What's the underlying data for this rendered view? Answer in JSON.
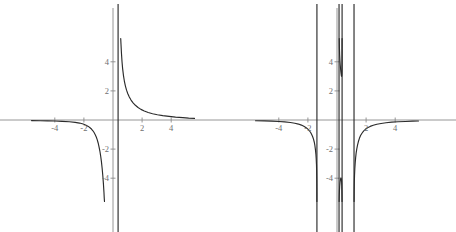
{
  "figure": {
    "kind": "two-panel-line-plot",
    "background_color": "#ffffff",
    "curve_color": "#2b2b2b",
    "axis_color": "#8a8a8a",
    "tick_label_color": "#6f6f6f"
  },
  "chart_data": [
    {
      "type": "line",
      "panel": "left",
      "title": "",
      "xlabel": "",
      "ylabel": "",
      "xlim": [
        -5.6,
        5.6
      ],
      "ylim": [
        -5.6,
        5.6
      ],
      "grid": false,
      "legend": null,
      "x_ticks": [
        -4,
        -2,
        2,
        4
      ],
      "x_tick_labels": [
        "-4",
        "-2",
        "2",
        "4"
      ],
      "y_ticks": [
        -4,
        -2,
        2,
        4
      ],
      "y_tick_labels": [
        "-4",
        "-2",
        "2",
        "4"
      ],
      "asymptotes": {
        "vertical": [
          0.35
        ],
        "horizontal": [
          0
        ]
      },
      "series": [
        {
          "name": "branch-left",
          "points": [
            [
              -5.6,
              -0.04
            ],
            [
              -5.0,
              -0.05
            ],
            [
              -4.5,
              -0.06
            ],
            [
              -4.0,
              -0.07
            ],
            [
              -3.5,
              -0.09
            ],
            [
              -3.0,
              -0.12
            ],
            [
              -2.6,
              -0.16
            ],
            [
              -2.3,
              -0.21
            ],
            [
              -2.05,
              -0.28
            ],
            [
              -1.85,
              -0.36
            ],
            [
              -1.7,
              -0.44
            ],
            [
              -1.58,
              -0.53
            ],
            [
              -1.48,
              -0.62
            ],
            [
              -1.38,
              -0.74
            ],
            [
              -1.3,
              -0.86
            ],
            [
              -1.22,
              -1.01
            ],
            [
              -1.15,
              -1.17
            ],
            [
              -1.08,
              -1.37
            ],
            [
              -1.02,
              -1.58
            ],
            [
              -0.96,
              -1.84
            ],
            [
              -0.9,
              -2.15
            ],
            [
              -0.85,
              -2.46
            ],
            [
              -0.8,
              -2.83
            ],
            [
              -0.75,
              -3.28
            ],
            [
              -0.7,
              -3.83
            ],
            [
              -0.66,
              -4.37
            ],
            [
              -0.62,
              -5.0
            ],
            [
              -0.6,
              -5.4
            ],
            [
              -0.585,
              -5.6
            ]
          ]
        },
        {
          "name": "branch-right",
          "points": [
            [
              0.53,
              5.6
            ],
            [
              0.55,
              5.2
            ],
            [
              0.58,
              4.6
            ],
            [
              0.62,
              4.0
            ],
            [
              0.66,
              3.55
            ],
            [
              0.72,
              3.05
            ],
            [
              0.78,
              2.68
            ],
            [
              0.85,
              2.35
            ],
            [
              0.93,
              2.05
            ],
            [
              1.02,
              1.8
            ],
            [
              1.12,
              1.58
            ],
            [
              1.24,
              1.37
            ],
            [
              1.38,
              1.18
            ],
            [
              1.54,
              1.01
            ],
            [
              1.72,
              0.86
            ],
            [
              1.92,
              0.73
            ],
            [
              2.15,
              0.62
            ],
            [
              2.42,
              0.52
            ],
            [
              2.72,
              0.43
            ],
            [
              3.05,
              0.36
            ],
            [
              3.42,
              0.3
            ],
            [
              3.85,
              0.25
            ],
            [
              4.3,
              0.2
            ],
            [
              4.8,
              0.16
            ],
            [
              5.2,
              0.13
            ],
            [
              5.6,
              0.11
            ]
          ]
        }
      ]
    },
    {
      "type": "line",
      "panel": "right",
      "title": "",
      "xlabel": "",
      "ylabel": "",
      "xlim": [
        -5.6,
        5.6
      ],
      "ylim": [
        -5.6,
        5.6
      ],
      "grid": false,
      "legend": null,
      "x_ticks": [
        -4,
        -2,
        2,
        4
      ],
      "x_tick_labels": [
        "-4",
        "-2",
        "2",
        "4"
      ],
      "y_ticks": [
        -4,
        -2,
        2,
        4
      ],
      "y_tick_labels": [
        "-4",
        "-2",
        "2",
        "4"
      ],
      "asymptotes": {
        "vertical": [
          -1.38,
          0.14,
          0.35,
          1.17
        ],
        "horizontal": [
          0
        ]
      },
      "series": [
        {
          "name": "branch-far-left",
          "points": [
            [
              -5.6,
              -0.05
            ],
            [
              -5.0,
              -0.06
            ],
            [
              -4.5,
              -0.08
            ],
            [
              -4.0,
              -0.1
            ],
            [
              -3.6,
              -0.13
            ],
            [
              -3.2,
              -0.17
            ],
            [
              -2.9,
              -0.22
            ],
            [
              -2.65,
              -0.28
            ],
            [
              -2.45,
              -0.35
            ],
            [
              -2.28,
              -0.43
            ],
            [
              -2.12,
              -0.53
            ],
            [
              -2.0,
              -0.63
            ],
            [
              -1.9,
              -0.74
            ],
            [
              -1.81,
              -0.86
            ],
            [
              -1.74,
              -0.99
            ],
            [
              -1.67,
              -1.15
            ],
            [
              -1.61,
              -1.33
            ],
            [
              -1.56,
              -1.53
            ],
            [
              -1.52,
              -1.75
            ],
            [
              -1.48,
              -2.05
            ],
            [
              -1.45,
              -2.35
            ],
            [
              -1.43,
              -2.65
            ],
            [
              -1.41,
              -3.05
            ],
            [
              -1.4,
              -3.45
            ],
            [
              -1.39,
              -4.05
            ],
            [
              -1.385,
              -4.7
            ],
            [
              -1.382,
              -5.6
            ]
          ],
          "note": "rendered as reflection: approaches 0 from above going left"
        },
        {
          "name": "u-shaped-middle-top",
          "points": [
            [
              0.155,
              5.6
            ],
            [
              0.165,
              5.0
            ],
            [
              0.18,
              4.5
            ],
            [
              0.2,
              4.1
            ],
            [
              0.222,
              3.78
            ],
            [
              0.245,
              3.52
            ],
            [
              0.265,
              3.32
            ],
            [
              0.282,
              3.18
            ],
            [
              0.295,
              3.08
            ],
            [
              0.305,
              3.02
            ],
            [
              0.315,
              3.0
            ],
            [
              0.322,
              3.02
            ],
            [
              0.33,
              3.1
            ],
            [
              0.336,
              3.25
            ],
            [
              0.341,
              3.5
            ],
            [
              0.345,
              3.85
            ],
            [
              0.347,
              4.25
            ],
            [
              0.349,
              4.8
            ],
            [
              0.35,
              5.6
            ]
          ]
        },
        {
          "name": "inverted-u-middle-bottom",
          "points": [
            [
              0.148,
              -5.6
            ],
            [
              0.155,
              -5.2
            ],
            [
              0.168,
              -4.85
            ],
            [
              0.185,
              -4.55
            ],
            [
              0.205,
              -4.32
            ],
            [
              0.228,
              -4.14
            ],
            [
              0.25,
              -4.03
            ],
            [
              0.27,
              -3.98
            ],
            [
              0.288,
              -4.0
            ],
            [
              0.305,
              -4.1
            ],
            [
              0.318,
              -4.28
            ],
            [
              0.328,
              -4.52
            ],
            [
              0.336,
              -4.85
            ],
            [
              0.342,
              -5.2
            ],
            [
              0.346,
              -5.6
            ]
          ]
        },
        {
          "name": "branch-far-right",
          "points": [
            [
              1.175,
              -5.6
            ],
            [
              1.18,
              -4.9
            ],
            [
              1.19,
              -4.3
            ],
            [
              1.205,
              -3.8
            ],
            [
              1.225,
              -3.35
            ],
            [
              1.25,
              -2.95
            ],
            [
              1.28,
              -2.6
            ],
            [
              1.315,
              -2.28
            ],
            [
              1.36,
              -1.98
            ],
            [
              1.41,
              -1.72
            ],
            [
              1.47,
              -1.48
            ],
            [
              1.54,
              -1.26
            ],
            [
              1.62,
              -1.07
            ],
            [
              1.715,
              -0.91
            ],
            [
              1.825,
              -0.76
            ],
            [
              1.95,
              -0.64
            ],
            [
              2.1,
              -0.53
            ],
            [
              2.28,
              -0.44
            ],
            [
              2.49,
              -0.36
            ],
            [
              2.74,
              -0.29
            ],
            [
              3.03,
              -0.24
            ],
            [
              3.37,
              -0.19
            ],
            [
              3.76,
              -0.15
            ],
            [
              4.2,
              -0.12
            ],
            [
              4.7,
              -0.1
            ],
            [
              5.2,
              -0.08
            ],
            [
              5.6,
              -0.07
            ]
          ]
        }
      ]
    }
  ]
}
